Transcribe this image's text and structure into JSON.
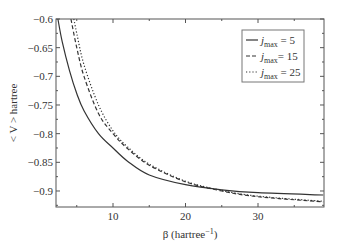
{
  "chart_data": {
    "type": "line",
    "title": "",
    "xlabel": "β (hartree⁻¹)",
    "ylabel": "< V > hartree",
    "xlim": [
      2.1,
      39
    ],
    "ylim": [
      -0.928,
      -0.6
    ],
    "x_ticks": [
      10,
      20,
      30
    ],
    "y_ticks": [
      -0.6,
      -0.65,
      -0.7,
      -0.75,
      -0.8,
      -0.85,
      -0.9
    ],
    "y_tick_labels": [
      "−0.6",
      "−0.65",
      "−0.7",
      "−0.75",
      "−0.8",
      "−0.85",
      "−0.9"
    ],
    "grid": false,
    "legend_position": "upper right",
    "series": [
      {
        "name": "jmax = 5",
        "style": "solid",
        "x": [
          2.4,
          3,
          4,
          5,
          6,
          8,
          10,
          12,
          15,
          20,
          25,
          30,
          39
        ],
        "values": [
          -0.6,
          -0.64,
          -0.69,
          -0.73,
          -0.76,
          -0.8,
          -0.825,
          -0.848,
          -0.872,
          -0.889,
          -0.898,
          -0.903,
          -0.907
        ]
      },
      {
        "name": "jmax = 15",
        "style": "dashed",
        "x": [
          4.2,
          5,
          6,
          8,
          10,
          12,
          15,
          20,
          25,
          30,
          39
        ],
        "values": [
          -0.6,
          -0.65,
          -0.7,
          -0.765,
          -0.8,
          -0.826,
          -0.855,
          -0.884,
          -0.9,
          -0.91,
          -0.919
        ]
      },
      {
        "name": "jmax = 25",
        "style": "dotted",
        "x": [
          4.6,
          5,
          6,
          8,
          10,
          12,
          15,
          20,
          25,
          30,
          39
        ],
        "values": [
          -0.6,
          -0.625,
          -0.68,
          -0.75,
          -0.795,
          -0.823,
          -0.853,
          -0.883,
          -0.899,
          -0.909,
          -0.918
        ]
      }
    ]
  },
  "legend": [
    {
      "symbol": "j",
      "sub": "max",
      "rest": " = 5"
    },
    {
      "symbol": "j",
      "sub": "max",
      "rest": "= 15"
    },
    {
      "symbol": "j",
      "sub": "max",
      "rest": " = 25"
    }
  ],
  "labels": {
    "xlabel_main": "β (hartree",
    "xlabel_sup": "−1",
    "xlabel_end": ")",
    "ylabel": "< V > hartree"
  }
}
